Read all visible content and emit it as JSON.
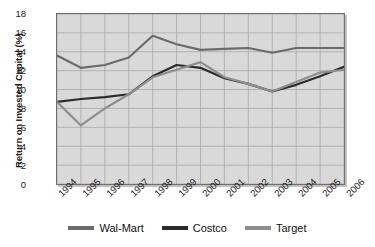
{
  "chart_data": {
    "type": "line",
    "title": "",
    "xlabel": "",
    "ylabel": "Return on Invested Capital (%)",
    "x": [
      "1994",
      "1995",
      "1996",
      "1997",
      "1998",
      "1999",
      "2000",
      "2001",
      "2002",
      "2003",
      "2004",
      "2005",
      "2006"
    ],
    "categories": [
      "1994",
      "1995",
      "1996",
      "1997",
      "1998",
      "1999",
      "2000",
      "2001",
      "2002",
      "2003",
      "2004",
      "2005",
      "2006"
    ],
    "ylim": [
      0,
      18
    ],
    "yticks": [
      0,
      2,
      4,
      6,
      8,
      10,
      12,
      14,
      16,
      18
    ],
    "grid": true,
    "legend_position": "bottom",
    "series": [
      {
        "name": "Wal-Mart",
        "color": "#6b6b6b",
        "values": [
          13.6,
          12.3,
          12.6,
          13.4,
          15.7,
          14.8,
          14.2,
          14.3,
          14.4,
          13.9,
          14.4,
          14.4,
          14.4
        ]
      },
      {
        "name": "Costco",
        "color": "#2b2b2b",
        "values": [
          8.7,
          9.0,
          9.2,
          9.5,
          11.4,
          12.6,
          12.3,
          11.2,
          10.6,
          9.8,
          10.5,
          11.4,
          12.4
        ]
      },
      {
        "name": "Target",
        "color": "#8e8e8e",
        "values": [
          8.7,
          6.2,
          8.0,
          9.5,
          11.3,
          12.1,
          12.9,
          11.3,
          10.6,
          9.8,
          10.8,
          11.8,
          12.1
        ]
      }
    ]
  },
  "yticks": {
    "t0": "0",
    "t2": "2",
    "t4": "4",
    "t6": "6",
    "t8": "8",
    "t10": "10",
    "t12": "12",
    "t14": "14",
    "t16": "16",
    "t18": "18"
  },
  "xticks": {
    "x0": "1994",
    "x1": "1995",
    "x2": "1996",
    "x3": "1997",
    "x4": "1998",
    "x5": "1999",
    "x6": "2000",
    "x7": "2001",
    "x8": "2002",
    "x9": "2003",
    "x10": "2004",
    "x11": "2005",
    "x12": "2006"
  },
  "legend": {
    "walmart": "Wal-Mart",
    "costco": "Costco",
    "target": "Target"
  },
  "axis": {
    "y_title": "Return on Invested Capital (%)"
  }
}
